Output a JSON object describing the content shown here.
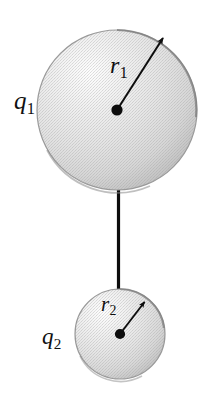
{
  "figure": {
    "background_color": "#ffffff",
    "width": 204,
    "height": 400,
    "labels": {
      "charge_top": {
        "symbol": "q",
        "subscript": "1"
      },
      "charge_bottom": {
        "symbol": "q",
        "subscript": "2"
      },
      "radius_top": {
        "symbol": "r",
        "subscript": "1"
      },
      "radius_bottom": {
        "symbol": "r",
        "subscript": "2"
      }
    },
    "objects": {
      "sphere_top": {
        "name": "large-sphere",
        "center_x": 117,
        "center_y": 110,
        "radius": 80,
        "fill_light": "#fbfbfb",
        "fill_mid": "#e2e2e2",
        "fill_dark": "#c6c6c6",
        "outline_color": "#8e8e8e"
      },
      "sphere_bottom": {
        "name": "small-sphere",
        "center_x": 120,
        "center_y": 334,
        "radius": 45,
        "fill_light": "#fbfbfb",
        "fill_mid": "#e2e2e2",
        "fill_dark": "#c6c6c6",
        "outline_color": "#8e8e8e"
      },
      "connecting_wire": {
        "name": "connecting-wire",
        "x": 118,
        "y_top": 190,
        "y_bottom": 292,
        "color": "#0d0d0d",
        "thickness": 3
      },
      "radius_arrow_top": {
        "name": "radius-arrow-top",
        "from_x": 117,
        "from_y": 110,
        "to_x": 165,
        "to_y": 35,
        "color": "#0d0d0d"
      },
      "radius_arrow_bottom": {
        "name": "radius-arrow-bottom",
        "from_x": 120,
        "from_y": 334,
        "to_x": 146,
        "to_y": 300,
        "color": "#0d0d0d"
      },
      "center_dot_top": {
        "name": "center-dot-top",
        "x": 117,
        "y": 110,
        "r": 5.5,
        "color": "#0d0d0d"
      },
      "center_dot_bottom": {
        "name": "center-dot-bottom",
        "x": 120,
        "y": 334,
        "r": 5.0,
        "color": "#0d0d0d"
      }
    }
  }
}
